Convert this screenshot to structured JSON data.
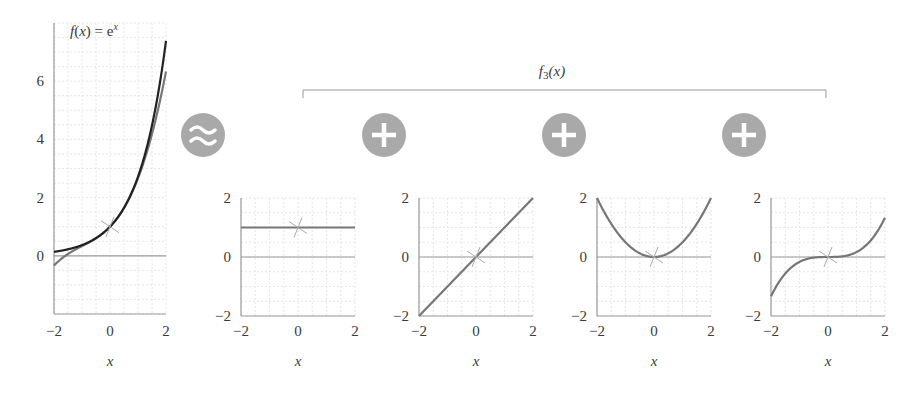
{
  "header": {
    "bracket_label": "f3(x)",
    "bracket_label_main": "f",
    "bracket_label_sub": "3",
    "bracket_label_arg": "(x)"
  },
  "main_plot": {
    "label_prefix": "f(x) = e",
    "label_sup": "x"
  },
  "operators": [
    {
      "symbol": "approx",
      "icon": "approx-icon"
    },
    {
      "symbol": "plus",
      "icon": "plus-icon"
    },
    {
      "symbol": "plus",
      "icon": "plus-icon"
    },
    {
      "symbol": "plus",
      "icon": "plus-icon"
    }
  ],
  "colors": {
    "exact_curve": "#222222",
    "approx_curve": "#777777",
    "operator_circle": "#a9a9a9",
    "axis": "#9a9a9a",
    "grid": "#e6e6e6"
  },
  "chart_data": [
    {
      "type": "line",
      "title": "f(x) = e^x",
      "xlabel": "x",
      "ylabel": "",
      "xlim": [
        -2,
        2
      ],
      "ylim": [
        -2,
        8
      ],
      "xticks": [
        "-2",
        "0",
        "2"
      ],
      "yticks": [
        "0",
        "2",
        "4",
        "6"
      ],
      "grid": true,
      "series": [
        {
          "name": "e^x",
          "expr": "exp",
          "x": [
            -2,
            -1,
            0,
            1,
            2
          ],
          "values": [
            0.135,
            0.368,
            1.0,
            2.718,
            7.389
          ]
        },
        {
          "name": "f3(x) = 1 + x + x^2/2 + x^3/6",
          "expr": "taylor3",
          "x": [
            -2,
            -1,
            0,
            1,
            2
          ],
          "values": [
            -0.333,
            0.333,
            1.0,
            2.667,
            6.333
          ]
        }
      ],
      "annotations": [
        "tangent marker at (0, 1)"
      ]
    },
    {
      "type": "line",
      "title": "term 0: 1",
      "xlabel": "x",
      "xlim": [
        -2,
        2
      ],
      "ylim": [
        -2,
        2
      ],
      "xticks": [
        "-2",
        "0",
        "2"
      ],
      "yticks": [
        "-2",
        "0",
        "2"
      ],
      "grid": true,
      "series": [
        {
          "name": "1",
          "expr": "t0",
          "x": [
            -2,
            -1,
            0,
            1,
            2
          ],
          "values": [
            1,
            1,
            1,
            1,
            1
          ]
        }
      ]
    },
    {
      "type": "line",
      "title": "term 1: x",
      "xlabel": "x",
      "xlim": [
        -2,
        2
      ],
      "ylim": [
        -2,
        2
      ],
      "xticks": [
        "-2",
        "0",
        "2"
      ],
      "yticks": [
        "-2",
        "0",
        "2"
      ],
      "grid": true,
      "series": [
        {
          "name": "x",
          "expr": "t1",
          "x": [
            -2,
            -1,
            0,
            1,
            2
          ],
          "values": [
            -2,
            -1,
            0,
            1,
            2
          ]
        }
      ]
    },
    {
      "type": "line",
      "title": "term 2: x^2/2",
      "xlabel": "x",
      "xlim": [
        -2,
        2
      ],
      "ylim": [
        -2,
        2
      ],
      "xticks": [
        "-2",
        "0",
        "2"
      ],
      "yticks": [
        "-2",
        "0",
        "2"
      ],
      "grid": true,
      "series": [
        {
          "name": "x^2/2",
          "expr": "t2",
          "x": [
            -2,
            -1,
            0,
            1,
            2
          ],
          "values": [
            2,
            0.5,
            0,
            0.5,
            2
          ]
        }
      ]
    },
    {
      "type": "line",
      "title": "term 3: x^3/6",
      "xlabel": "x",
      "xlim": [
        -2,
        2
      ],
      "ylim": [
        -2,
        2
      ],
      "xticks": [
        "-2",
        "0",
        "2"
      ],
      "yticks": [
        "-2",
        "0",
        "2"
      ],
      "grid": true,
      "series": [
        {
          "name": "x^3/6",
          "expr": "t3",
          "x": [
            -2,
            -1,
            0,
            1,
            2
          ],
          "values": [
            -1.333,
            -0.167,
            0,
            0.167,
            1.333
          ]
        }
      ]
    }
  ]
}
